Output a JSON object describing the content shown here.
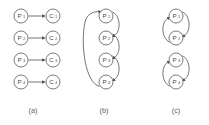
{
  "figure": {
    "background_color": "#ffffff",
    "stroke_color": "#5c5c5c",
    "node_stroke_color": "#6b6b6b",
    "text_color": "#4a4a4a"
  },
  "panels": [
    {
      "caption": "(a)",
      "caption_x": 33,
      "caption_y": 113,
      "structure": "four-independent-producer-consumer-pairs",
      "nodes": [
        {
          "id": "a-P1",
          "base": "P",
          "sub": "1",
          "cx": 21,
          "cy": 16,
          "r": 7
        },
        {
          "id": "a-C1",
          "base": "C",
          "sub": "1",
          "cx": 53,
          "cy": 16,
          "r": 7
        },
        {
          "id": "a-P2",
          "base": "P",
          "sub": "2",
          "cx": 21,
          "cy": 38,
          "r": 7
        },
        {
          "id": "a-C2",
          "base": "C",
          "sub": "2",
          "cx": 53,
          "cy": 38,
          "r": 7
        },
        {
          "id": "a-P3",
          "base": "P",
          "sub": "3",
          "cx": 21,
          "cy": 60,
          "r": 7
        },
        {
          "id": "a-C3",
          "base": "C",
          "sub": "3",
          "cx": 53,
          "cy": 60,
          "r": 7
        },
        {
          "id": "a-P4",
          "base": "P",
          "sub": "4",
          "cx": 21,
          "cy": 82,
          "r": 7
        },
        {
          "id": "a-C4",
          "base": "C",
          "sub": "4",
          "cx": 53,
          "cy": 82,
          "r": 7
        }
      ],
      "edges": [
        {
          "from": "P1",
          "to": "C1",
          "kind": "straight"
        },
        {
          "from": "P2",
          "to": "C2",
          "kind": "straight"
        },
        {
          "from": "P3",
          "to": "C3",
          "kind": "straight"
        },
        {
          "from": "P4",
          "to": "C4",
          "kind": "straight"
        }
      ]
    },
    {
      "caption": "(b)",
      "caption_x": 104,
      "caption_y": 113,
      "structure": "single-four-node-cycle",
      "nodes": [
        {
          "id": "b-P1",
          "base": "P",
          "sub": "1",
          "cx": 106,
          "cy": 16,
          "r": 7
        },
        {
          "id": "b-P2",
          "base": "P",
          "sub": "2",
          "cx": 106,
          "cy": 38,
          "r": 7
        },
        {
          "id": "b-P3",
          "base": "P",
          "sub": "3",
          "cx": 106,
          "cy": 60,
          "r": 7
        },
        {
          "id": "b-P4",
          "base": "P",
          "sub": "4",
          "cx": 106,
          "cy": 82,
          "r": 7
        }
      ],
      "edges": [
        {
          "from": "P1",
          "to": "P2",
          "kind": "arc-right"
        },
        {
          "from": "P2",
          "to": "P3",
          "kind": "arc-right"
        },
        {
          "from": "P3",
          "to": "P4",
          "kind": "arc-right"
        },
        {
          "from": "P4",
          "to": "P1",
          "kind": "arc-left-long"
        }
      ]
    },
    {
      "caption": "(c)",
      "caption_x": 176,
      "caption_y": 113,
      "structure": "two-separate-two-node-cycles",
      "nodes": [
        {
          "id": "c-P1",
          "base": "P",
          "sub": "1",
          "cx": 176,
          "cy": 16,
          "r": 7
        },
        {
          "id": "c-P2",
          "base": "P",
          "sub": "2",
          "cx": 176,
          "cy": 38,
          "r": 7
        },
        {
          "id": "c-P3",
          "base": "P",
          "sub": "3",
          "cx": 176,
          "cy": 60,
          "r": 7
        },
        {
          "id": "c-P4",
          "base": "P",
          "sub": "4",
          "cx": 176,
          "cy": 82,
          "r": 7
        }
      ],
      "edges": [
        {
          "from": "P1",
          "to": "P2",
          "kind": "arc-right"
        },
        {
          "from": "P2",
          "to": "P1",
          "kind": "arc-left"
        },
        {
          "from": "P3",
          "to": "P4",
          "kind": "arc-right"
        },
        {
          "from": "P4",
          "to": "P3",
          "kind": "arc-left"
        }
      ]
    }
  ]
}
